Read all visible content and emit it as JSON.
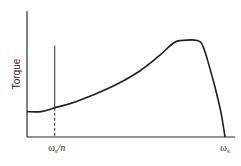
{
  "chart_data": {
    "type": "line",
    "title": "",
    "ylabel": "Torque",
    "xlabel": "",
    "x_tick_labels": [
      {
        "name": "omega-s-over-n",
        "symbol": "ω",
        "subscript": "s",
        "suffix": "/n",
        "x": 0.14
      },
      {
        "name": "omega-s",
        "symbol": "ω",
        "subscript": "s",
        "suffix": "",
        "x": 1.0
      }
    ],
    "xlim": [
      0,
      1.05
    ],
    "ylim": [
      0,
      1.0
    ],
    "series": [
      {
        "name": "torque-speed-curve",
        "x": [
          0.0,
          0.07,
          0.14,
          0.25,
          0.42,
          0.55,
          0.66,
          0.74,
          0.78,
          0.86,
          0.89,
          0.92,
          0.95,
          0.98,
          1.0
        ],
        "y": [
          0.2,
          0.2,
          0.23,
          0.28,
          0.39,
          0.5,
          0.63,
          0.74,
          0.76,
          0.76,
          0.71,
          0.56,
          0.39,
          0.19,
          0.0
        ]
      }
    ],
    "annotations": [
      {
        "type": "vertical-line",
        "x": 0.14,
        "solid_above_curve": true,
        "dashed_below_curve": true,
        "top": 0.72
      }
    ],
    "grid": false,
    "legend": "none"
  }
}
